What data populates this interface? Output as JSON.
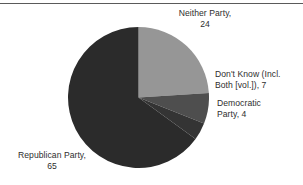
{
  "chart_data": {
    "type": "pie",
    "title": "",
    "subtitle": "",
    "xlabel": "",
    "ylabel": "",
    "legend_position": "none",
    "grid": false,
    "units": "percent",
    "start_angle_deg": 0,
    "direction": "clockwise",
    "categories": [
      "Neither Party",
      "Don't Know (Incl. Both [vol.])",
      "Democratic Party",
      "Republican Party"
    ],
    "values": [
      24,
      7,
      4,
      65
    ],
    "colors": [
      "#969696",
      "#4e4e4e",
      "#343434",
      "#2b2b2b"
    ],
    "slices": [
      {
        "name": "Neither Party",
        "value": 24,
        "color": "#969696",
        "label_text": "Neither Party,\n24",
        "label_position": "top-right"
      },
      {
        "name": "Don't Know (Incl. Both [vol.])",
        "value": 7,
        "color": "#4e4e4e",
        "label_text": "Don't Know (Incl.\nBoth [vol.]), 7",
        "label_position": "right"
      },
      {
        "name": "Democratic Party",
        "value": 4,
        "color": "#343434",
        "label_text": "Democratic\nParty, 4",
        "label_position": "right-lower"
      },
      {
        "name": "Republican Party",
        "value": 65,
        "color": "#2b2b2b",
        "label_text": "Republican Party,\n65",
        "label_position": "bottom-left"
      }
    ]
  },
  "labels": {
    "neither": "Neither Party,\n24",
    "dont_know": "Don't Know (Incl.\nBoth [vol.]), 7",
    "democratic": "Democratic\nParty, 4",
    "republican": "Republican Party,\n65"
  },
  "style": {
    "background": "#ffffff",
    "text_color": "#2e2e2e",
    "rule_color": "#5a5a5a"
  }
}
